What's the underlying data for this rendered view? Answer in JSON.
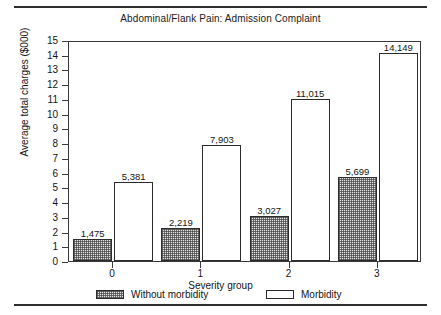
{
  "figure": {
    "title": "Abdominal/Flank Pain: Admission Complaint",
    "top_rule": "",
    "bottom_rule": ""
  },
  "chart_data": {
    "type": "bar",
    "title": "Abdominal/Flank Pain: Admission Complaint",
    "xlabel": "Severity group",
    "ylabel": "Average total charges ($000)",
    "categories": [
      "0",
      "1",
      "2",
      "3"
    ],
    "ylim": [
      0,
      15
    ],
    "yticks": [
      "0",
      "1",
      "2",
      "3",
      "4",
      "5",
      "6",
      "7",
      "8",
      "9",
      "10",
      "11",
      "12",
      "13",
      "14",
      "15"
    ],
    "grid": false,
    "legend_position": "below-axes",
    "series": [
      {
        "name": "Without morbidity",
        "fill": "hatched",
        "values": [
          1475,
          2219,
          3027,
          5699
        ],
        "labels": [
          "1,475",
          "2,219",
          "3,027",
          "5,699"
        ]
      },
      {
        "name": "Morbidity",
        "fill": "white",
        "values": [
          5381,
          7903,
          11015,
          14149
        ],
        "labels": [
          "5,381",
          "7,903",
          "11,015",
          "14,149"
        ]
      }
    ]
  },
  "legend": {
    "items": [
      {
        "label": "Without morbidity",
        "swatch": "hatched-swatch"
      },
      {
        "label": "Morbidity",
        "swatch": "white-swatch"
      }
    ]
  }
}
